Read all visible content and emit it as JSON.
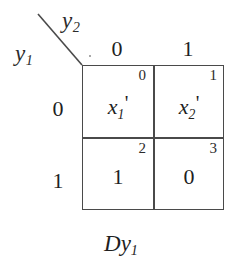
{
  "figure": {
    "type": "karnaugh-map",
    "caption_prefix": "D",
    "caption_var": "y",
    "caption_sub": "1",
    "column_variable": {
      "name": "y",
      "sub": "2"
    },
    "row_variable": {
      "name": "y",
      "sub": "1"
    },
    "column_headers": [
      "0",
      "1"
    ],
    "row_headers": [
      "0",
      "1"
    ],
    "cells": [
      {
        "index": "0",
        "value": "x",
        "sub": "1",
        "prime": "'",
        "is_expression": true
      },
      {
        "index": "1",
        "value": "x",
        "sub": "2",
        "prime": "'",
        "is_expression": true
      },
      {
        "index": "2",
        "value": "1",
        "sub": "",
        "prime": "",
        "is_expression": false
      },
      {
        "index": "3",
        "value": "0",
        "sub": "",
        "prime": "",
        "is_expression": false
      }
    ]
  },
  "colors": {
    "background": "#ffffff",
    "line": "#4a4a4a",
    "text": "#1f1f1f"
  }
}
